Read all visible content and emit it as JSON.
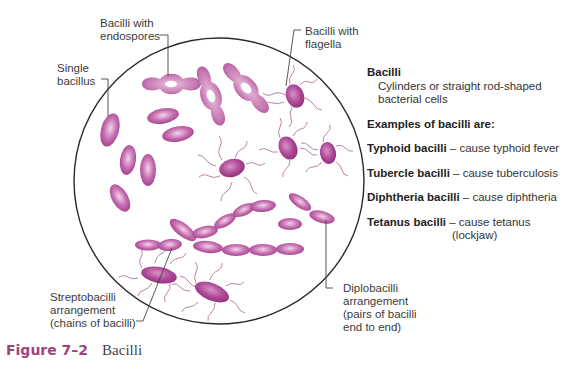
{
  "labels": {
    "endospores": [
      "Bacilli with",
      "endospores"
    ],
    "flagella": [
      "Bacilli with",
      "flagella"
    ],
    "single": [
      "Single",
      "bacillus"
    ],
    "strepto": [
      "Streptobacilli",
      "arrangement",
      "(chains of bacilli)"
    ],
    "diplo": [
      "Diplobacilli",
      "arrangement",
      "(pairs of bacilli",
      "end to end)"
    ]
  },
  "panel": {
    "heading": "Bacilli",
    "description_line1": "Cylinders or straight rod-shaped",
    "description_line2": "bacterial cells",
    "examples_heading": "Examples of bacilli are:",
    "examples": [
      {
        "name": "Typhoid bacilli",
        "effect": " – cause typhoid fever"
      },
      {
        "name": "Tubercle bacilli",
        "effect": " – cause tuberculosis"
      },
      {
        "name": "Diphtheria bacilli",
        "effect": " – cause diphtheria"
      },
      {
        "name": "Tetanus bacilli",
        "effect": " – cause tetanus",
        "effect_cont": "(lockjaw)"
      }
    ]
  },
  "caption": {
    "figure_number": "Figure 7–2",
    "title": "Bacilli"
  },
  "colors": {
    "bacteria": "#a8418f",
    "bacteria_light": "#e3b6d8",
    "flagella": "#b57aa8",
    "circle": "#2a2a2a",
    "caption_accent": "#a0447e"
  }
}
